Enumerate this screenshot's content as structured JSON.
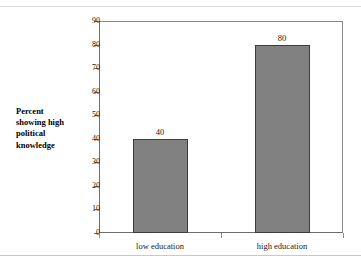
{
  "chart_data": {
    "type": "bar",
    "title": "",
    "subtitle": "",
    "xlabel": "",
    "ylabel": "Percent showing high political knowledge",
    "categories": [
      "low education",
      "high education"
    ],
    "values": [
      40,
      80
    ],
    "value_labels": [
      "40",
      "80"
    ],
    "ylim": [
      0,
      90
    ],
    "ytick_values": [
      0,
      10,
      20,
      30,
      40,
      50,
      60,
      70,
      80,
      90
    ],
    "ytick_labels": [
      "0",
      "10",
      "20",
      "30",
      "40",
      "50",
      "60",
      "70",
      "80",
      "90"
    ],
    "grid": false,
    "legend": false,
    "legend_position": "none",
    "bar_color": "#818181",
    "bar_border_color": "#3c3c3c",
    "axis_color": "#6e6e6e",
    "background": "#ffffff"
  },
  "axis_title": {
    "line1": "Percent",
    "line2": "showing high",
    "line3": "political",
    "line4": "knowledge"
  }
}
